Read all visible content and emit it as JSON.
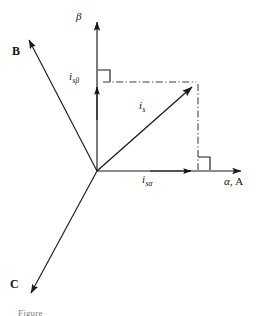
{
  "figure": {
    "kind": "phasor-diagram",
    "caption_partial": "Figure",
    "stroke_color": "#1a1a1a",
    "dash_color": "#4d4d4d",
    "background": "#ffffff"
  },
  "axes": {
    "origin": {
      "x": 97,
      "y": 171
    },
    "beta": {
      "label": "β",
      "label_x": 76,
      "label_y": 10,
      "tip": {
        "x": 97,
        "y": 16
      }
    },
    "alpha": {
      "greek": "α",
      "separator": ", ",
      "phase": "A",
      "label_x": 226,
      "label_y": 181,
      "tip": {
        "x": 247,
        "y": 171
      }
    }
  },
  "phase_axes": [
    {
      "label": "B",
      "label_x": 13,
      "label_y": 49,
      "tip": {
        "x": 25,
        "y": 33
      }
    },
    {
      "label": "C",
      "label_x": 11,
      "label_y": 281,
      "tip": {
        "x": 27,
        "y": 300
      }
    }
  ],
  "vectors": [
    {
      "name": "is",
      "base": "i",
      "sub": "s",
      "label_x": 139,
      "label_y": 104,
      "tip": {
        "x": 197,
        "y": 82
      }
    },
    {
      "name": "is-alpha",
      "base": "i",
      "sub": "sα",
      "label_x": 142,
      "label_y": 178,
      "tip": {
        "x": 196,
        "y": 171
      }
    },
    {
      "name": "is-beta",
      "base": "i",
      "sub": "sβ",
      "label_x": 70,
      "label_y": 74,
      "tip": {
        "x": 97,
        "y": 82
      }
    }
  ],
  "projection_lines": [
    {
      "name": "horizontal-projection",
      "x1": 103,
      "y1": 82,
      "x2": 197,
      "y2": 82
    },
    {
      "name": "vertical-projection",
      "x1": 198,
      "y1": 84,
      "x2": 198,
      "y2": 170
    }
  ],
  "right_angle_marks": [
    {
      "name": "right-angle-beta",
      "x": 98,
      "y": 70,
      "size": 12
    },
    {
      "name": "right-angle-alpha",
      "x": 198,
      "y": 157,
      "size": 12
    }
  ]
}
